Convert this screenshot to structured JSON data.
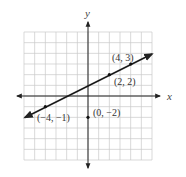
{
  "chart_data": {
    "type": "line",
    "title": "",
    "xlabel": "x",
    "ylabel": "y",
    "xlim": [
      -6,
      6
    ],
    "ylim": [
      -6,
      6
    ],
    "grid": true,
    "series": [
      {
        "name": "line y = 0.5x + 1",
        "x": [
          -6,
          6
        ],
        "y": [
          -2,
          4
        ],
        "arrows_both_ends": true
      }
    ],
    "points": [
      {
        "x": 4,
        "y": 3,
        "label": "(4, 3)",
        "on_line": true
      },
      {
        "x": 2,
        "y": 2,
        "label": "(2, 2)",
        "on_line": true
      },
      {
        "x": -4,
        "y": -1,
        "label": "(−4, −1)",
        "on_line": true
      },
      {
        "x": 0,
        "y": -2,
        "label": "(0, −2)",
        "on_line": false
      }
    ]
  },
  "axes": {
    "x_label": "x",
    "y_label": "y"
  },
  "labels": {
    "p1": "(4, 3)",
    "p2": "(2, 2)",
    "p3": "(−4, −1)",
    "p4": "(0, −2)"
  },
  "colors": {
    "grid": "#c8c8c8",
    "axis": "#222222",
    "line": "#1a1a1a",
    "text": "#333333"
  }
}
